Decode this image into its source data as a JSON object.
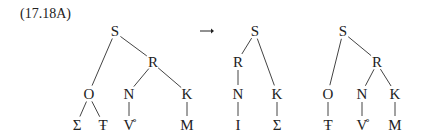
{
  "example_label": "(17.18A)",
  "arrow": "→",
  "trees": [
    {
      "nodes": [
        {
          "id": "S",
          "label": "S",
          "x": 115,
          "y": 31
        },
        {
          "id": "R",
          "label": "R",
          "x": 153,
          "y": 62
        },
        {
          "id": "O",
          "label": "O",
          "x": 89,
          "y": 94
        },
        {
          "id": "N",
          "label": "N",
          "x": 129,
          "y": 94
        },
        {
          "id": "K",
          "label": "K",
          "x": 187,
          "y": 94
        },
        {
          "id": "Sigma",
          "label": "Σ",
          "x": 77,
          "y": 125
        },
        {
          "id": "Tbar",
          "label": "Ŧ",
          "x": 103,
          "y": 125
        },
        {
          "id": "Vring",
          "label": "V̊",
          "x": 129,
          "y": 125
        },
        {
          "id": "M",
          "label": "M",
          "x": 187,
          "y": 125
        }
      ],
      "edges": [
        [
          "S",
          "O"
        ],
        [
          "S",
          "R"
        ],
        [
          "R",
          "N"
        ],
        [
          "R",
          "K"
        ],
        [
          "O",
          "Sigma"
        ],
        [
          "O",
          "Tbar"
        ],
        [
          "N",
          "Vring"
        ],
        [
          "K",
          "M"
        ]
      ]
    },
    {
      "nodes": [
        {
          "id": "S",
          "label": "S",
          "x": 255,
          "y": 31
        },
        {
          "id": "R",
          "label": "R",
          "x": 238,
          "y": 62
        },
        {
          "id": "N",
          "label": "N",
          "x": 238,
          "y": 94
        },
        {
          "id": "K",
          "label": "K",
          "x": 277,
          "y": 94
        },
        {
          "id": "I",
          "label": "I",
          "x": 238,
          "y": 125
        },
        {
          "id": "Sigma",
          "label": "Σ",
          "x": 277,
          "y": 125
        }
      ],
      "edges": [
        [
          "S",
          "R"
        ],
        [
          "S",
          "K"
        ],
        [
          "R",
          "N"
        ],
        [
          "N",
          "I"
        ],
        [
          "K",
          "Sigma"
        ]
      ]
    },
    {
      "nodes": [
        {
          "id": "S",
          "label": "S",
          "x": 343,
          "y": 31
        },
        {
          "id": "R",
          "label": "R",
          "x": 377,
          "y": 62
        },
        {
          "id": "O",
          "label": "O",
          "x": 328,
          "y": 94
        },
        {
          "id": "N",
          "label": "N",
          "x": 362,
          "y": 94
        },
        {
          "id": "K",
          "label": "K",
          "x": 395,
          "y": 94
        },
        {
          "id": "Tbar",
          "label": "Ŧ",
          "x": 328,
          "y": 125
        },
        {
          "id": "Vring",
          "label": "V̊",
          "x": 362,
          "y": 125
        },
        {
          "id": "M",
          "label": "M",
          "x": 395,
          "y": 125
        }
      ],
      "edges": [
        [
          "S",
          "O"
        ],
        [
          "S",
          "R"
        ],
        [
          "R",
          "N"
        ],
        [
          "R",
          "K"
        ],
        [
          "O",
          "Tbar"
        ],
        [
          "N",
          "Vring"
        ],
        [
          "K",
          "M"
        ]
      ]
    }
  ]
}
